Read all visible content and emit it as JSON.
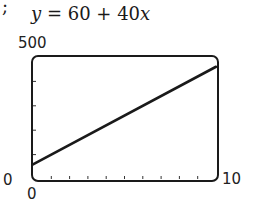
{
  "corner_mark": ";",
  "chart_data": {
    "type": "line",
    "title": "y = 60 + 40x",
    "title_parts": {
      "y": "y",
      "eq": " = 60 + 40",
      "x": "x"
    },
    "xlabel": "",
    "ylabel": "",
    "xlim": [
      0,
      10
    ],
    "ylim": [
      0,
      500
    ],
    "x_tick_labels": {
      "min": "0",
      "max": "10"
    },
    "y_tick_labels": {
      "min": "0",
      "max": "500"
    },
    "x_ticks_count": 10,
    "y_ticks_count": 5,
    "grid": false,
    "legend": null,
    "series": [
      {
        "name": "y = 60 + 40x",
        "x": [
          0,
          10
        ],
        "y": [
          60,
          460
        ]
      }
    ]
  }
}
